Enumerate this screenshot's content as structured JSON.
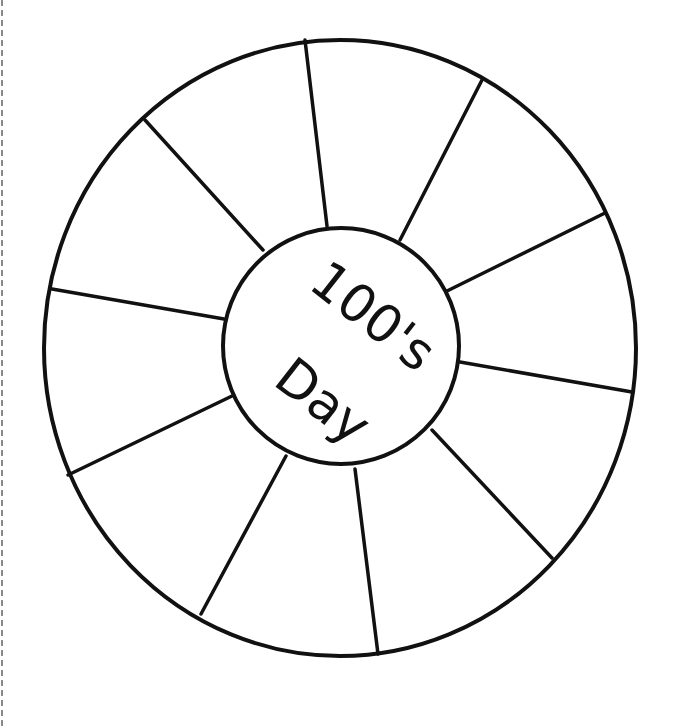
{
  "worksheet": {
    "title_line1": "100's",
    "title_line2": "Day",
    "segment_count": 12,
    "colors": {
      "ink": "#111111",
      "paper": "#ffffff",
      "cut_line": "#8a8a8a"
    },
    "outer_circle": {
      "cx": 340,
      "cy": 348,
      "rx": 296,
      "ry": 308
    },
    "inner_circle": {
      "cx": 341,
      "cy": 346,
      "r": 118
    },
    "spokes": [
      {
        "x1": 305,
        "y1": 40,
        "x2": 327,
        "y2": 226
      },
      {
        "x1": 482,
        "y1": 80,
        "x2": 400,
        "y2": 240
      },
      {
        "x1": 605,
        "y1": 213,
        "x2": 447,
        "y2": 291
      },
      {
        "x1": 632,
        "y1": 392,
        "x2": 460,
        "y2": 362
      },
      {
        "x1": 552,
        "y1": 558,
        "x2": 432,
        "y2": 430
      },
      {
        "x1": 378,
        "y1": 654,
        "x2": 355,
        "y2": 469
      },
      {
        "x1": 201,
        "y1": 614,
        "x2": 286,
        "y2": 456
      },
      {
        "x1": 68,
        "y1": 475,
        "x2": 232,
        "y2": 396
      },
      {
        "x1": 52,
        "y1": 289,
        "x2": 224,
        "y2": 319
      },
      {
        "x1": 145,
        "y1": 120,
        "x2": 263,
        "y2": 250
      }
    ]
  }
}
